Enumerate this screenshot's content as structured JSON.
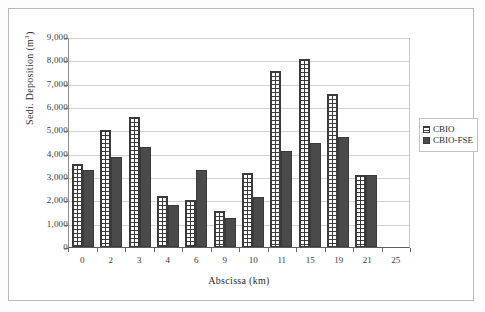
{
  "chart_data": {
    "type": "bar",
    "title": "",
    "xlabel": "Abscissa (km)",
    "ylabel": "Sedi. Deposition (m3)",
    "ylabel_base": "Sedi. Deposition (m",
    "ylabel_exponent": "3",
    "ylabel_close": ")",
    "categories": [
      "0",
      "2",
      "3",
      "4",
      "6",
      "9",
      "10",
      "11",
      "15",
      "19",
      "21",
      "25"
    ],
    "yticks": [
      "0",
      "1,000",
      "2,000",
      "3,000",
      "4,000",
      "5,000",
      "6,000",
      "7,000",
      "8,000",
      "9,000"
    ],
    "ylim": [
      0,
      9000
    ],
    "ytick_step": 1000,
    "grid": true,
    "legend_position": "right",
    "series": [
      {
        "name": "CBIO",
        "color": "#ffffff",
        "pattern": "dotted-hatch",
        "values": [
          3550,
          5020,
          5590,
          2180,
          2000,
          1560,
          3170,
          7560,
          8040,
          6570,
          3080,
          null
        ]
      },
      {
        "name": "CBIO-FSE",
        "color": "#4a4a4a",
        "pattern": "solid",
        "values": [
          3290,
          3870,
          4290,
          1790,
          3320,
          1230,
          2150,
          4120,
          4450,
          4730,
          3080,
          null
        ]
      }
    ]
  },
  "legend": {
    "items": [
      {
        "label": "CBIO"
      },
      {
        "label": "CBIO-FSE"
      }
    ]
  }
}
